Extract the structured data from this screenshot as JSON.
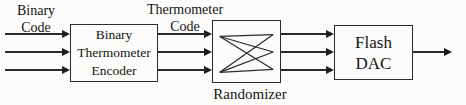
{
  "labels": {
    "binary_code": {
      "line1": "Binary",
      "line2": "Code"
    },
    "thermometer_code": {
      "line1": "Thermometer",
      "line2": "Code"
    },
    "randomizer": "Randomizer"
  },
  "blocks": {
    "encoder": {
      "line1": "Binary",
      "line2": "Thermometer",
      "line3": "Encoder"
    },
    "flash_dac": {
      "line1": "Flash",
      "line2": "DAC"
    }
  },
  "connections": {
    "binary_input_lines": 3,
    "thermometer_lines": 3,
    "randomized_lines": 3,
    "analog_output_lines": 1
  },
  "colors": {
    "line": "#2b2b2b",
    "text": "#141414",
    "background": "#fcfcfa"
  }
}
